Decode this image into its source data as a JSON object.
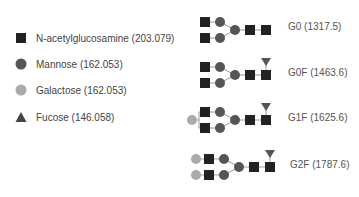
{
  "colors": {
    "glcnac": "#222222",
    "mannose": "#555555",
    "galactose": "#aaaaaa",
    "fucose": "#555555",
    "link": "#999999"
  },
  "legend": [
    {
      "symbol": "square",
      "label": "N-acetylglucosamine (203.079)"
    },
    {
      "symbol": "circle-dark",
      "label": "Mannose (162.053)"
    },
    {
      "symbol": "circle-light",
      "label": "Galactose (162.053)"
    },
    {
      "symbol": "triangle",
      "label": "Fucose (146.058)"
    }
  ],
  "glycans": [
    {
      "name": "G0",
      "label": "G0 (1317.5)",
      "galactose": 0,
      "fucose": false
    },
    {
      "name": "G0F",
      "label": "G0F (1463.6)",
      "galactose": 0,
      "fucose": true
    },
    {
      "name": "G1F",
      "label": "G1F (1625.6)",
      "galactose": 1,
      "fucose": true
    },
    {
      "name": "G2F",
      "label": "G2F (1787.6)",
      "galactose": 2,
      "fucose": true
    }
  ]
}
